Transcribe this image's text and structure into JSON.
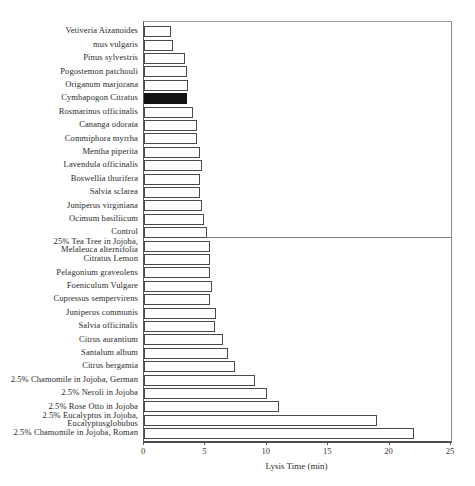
{
  "chart_data": {
    "type": "bar",
    "orientation": "horizontal",
    "title": "",
    "xlabel": "Lysis Time (min)",
    "ylabel": "",
    "xlim": [
      0,
      25
    ],
    "xticks": [
      "0",
      "5",
      "10",
      "15",
      "20",
      "25"
    ],
    "grid": false,
    "legend": false,
    "categories": [
      "Vetiveria Aizanoides",
      "mus vulgaris",
      "Pinus sylvestris",
      "Pogostemon patchouli",
      "Origanum marjorana",
      "Cymbapogon Citratus",
      "Rosmarinus officinalis",
      "Cananga odorata",
      "Commiphora myrrha",
      "Mentha piperita",
      "Lavendula officinalis",
      "Boswellia thurifera",
      "Salvia sclarea",
      "Juniperus virginiana",
      "Ocimum basiliicum",
      "Control",
      "25% Tea Tree in Jojoba,\nMelaleuca alternifolia",
      "Citratus Lemon",
      "Pelagonium graveolens",
      "Foeniculum Vulgare",
      "Cupressus sempervirens",
      "Juniperus communis",
      "Salvia officinalis",
      "Citrus aurantium",
      "Santalum album",
      "Citrus bergamia",
      "2.5% Chamomile in Jojoba, German",
      "2.5% Neroli in Jojoba",
      "2.5% Rose Otto in Jojoba",
      "2.5% Eucalyptus in Jojoba,\nEucalyptusglobubus",
      "2.5% Chamomile in Jojoba, Roman"
    ],
    "values": [
      2.2,
      2.4,
      3.3,
      3.5,
      3.6,
      3.5,
      4.0,
      4.3,
      4.3,
      4.6,
      4.7,
      4.6,
      4.6,
      4.7,
      4.9,
      5.1,
      5.4,
      5.4,
      5.4,
      5.5,
      5.4,
      5.9,
      5.8,
      6.4,
      6.8,
      7.4,
      9.0,
      10.0,
      11.0,
      19.0,
      22.0
    ],
    "highlight_index": 5,
    "highlight_category": "Cymbapogon Citratus",
    "reference_line": {
      "row_label": "Control",
      "row_index": 15,
      "value": 5.1,
      "extends_to": "right-edge"
    }
  },
  "colors": {
    "background": "#ffffff",
    "bar_fill": "#ffffff",
    "bar_border": "#4a4a4a",
    "highlight_fill": "#121212",
    "axis_line": "#4f4f4f",
    "frame_line": "#9a9a9a",
    "reference_line": "#7a7a7a",
    "text": "#2b2b2b"
  }
}
